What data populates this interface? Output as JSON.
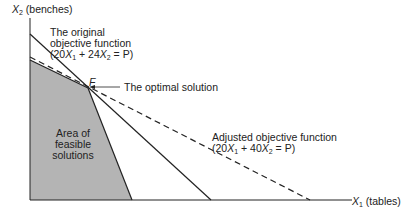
{
  "axes": {
    "y_label_var": "X",
    "y_label_sub": "2",
    "y_label_unit": "(benches)",
    "x_label_var": "X",
    "x_label_sub": "1",
    "x_label_unit": "(tables)"
  },
  "annotations": {
    "original_line1": "The original",
    "original_line2": "objective function",
    "original_eq_a": "(20",
    "original_eq_b": "+ 24",
    "original_eq_c": "= P)",
    "point_label": "F",
    "optimal": "The optimal solution",
    "adjusted_line1": "Adjusted objective function",
    "adjusted_eq_a": "(20",
    "adjusted_eq_b": "+ 40",
    "adjusted_eq_c": "= P)",
    "feasible_line1": "Area of",
    "feasible_line2": "feasible",
    "feasible_line3": "solutions"
  },
  "colors": {
    "feasible_fill": "#b4b4b4",
    "line": "#222222"
  }
}
